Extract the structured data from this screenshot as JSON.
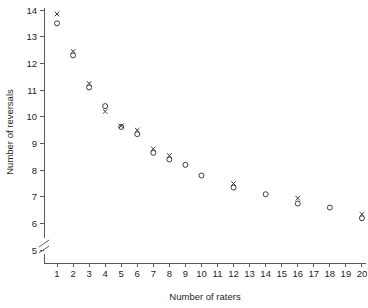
{
  "chart_data": {
    "type": "scatter",
    "title": "",
    "xlabel": "Number of raters",
    "ylabel": "Number of reversals",
    "xlim": [
      1,
      20
    ],
    "ylim": [
      5,
      14
    ],
    "xticks": [
      1,
      2,
      3,
      4,
      5,
      6,
      7,
      8,
      9,
      10,
      11,
      12,
      13,
      14,
      15,
      16,
      17,
      18,
      19,
      20
    ],
    "xtick_labels": [
      "1",
      "2",
      "3",
      "4",
      "5",
      "6",
      "7",
      "8",
      "9",
      "10",
      "11",
      "12",
      "13",
      "14",
      "15",
      "16",
      "17",
      "18",
      "19",
      "20"
    ],
    "yticks": [
      5,
      6,
      7,
      8,
      9,
      10,
      11,
      12,
      13,
      14
    ],
    "ytick_labels": [
      "5",
      "6",
      "7",
      "8",
      "9",
      "10",
      "11",
      "12",
      "13",
      "14"
    ],
    "grid": false,
    "legend": false,
    "y_axis_break": true,
    "marker_color": "#3b3b3f",
    "axis_color": "#58595b",
    "series": [
      {
        "name": "circle-series",
        "marker": "circle",
        "x": [
          1,
          2,
          3,
          4,
          5,
          6,
          7,
          8,
          9,
          10,
          12,
          14,
          16,
          18,
          20
        ],
        "y": [
          13.5,
          12.3,
          11.1,
          10.4,
          9.62,
          9.35,
          8.65,
          8.4,
          8.2,
          7.8,
          7.35,
          7.1,
          6.75,
          6.6,
          6.2
        ]
      },
      {
        "name": "cross-series",
        "marker": "x",
        "x": [
          1,
          2,
          3,
          4,
          5,
          6,
          7,
          8,
          12,
          16,
          20
        ],
        "y": [
          13.85,
          12.45,
          11.25,
          10.2,
          9.66,
          9.5,
          8.8,
          8.55,
          7.5,
          6.95,
          6.35
        ]
      }
    ]
  }
}
